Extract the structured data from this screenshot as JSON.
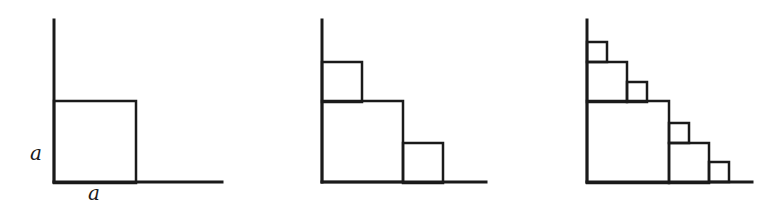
{
  "figure": {
    "panels": [
      {
        "id": "stage-1",
        "axes": {
          "origin": [
            54,
            182
          ],
          "y_top": 20,
          "x_end": 222
        },
        "squares": [
          {
            "x": 54,
            "y": 101,
            "size": 82,
            "level": 0
          }
        ],
        "labels": {
          "side_vertical": "a",
          "side_horizontal": "a"
        }
      },
      {
        "id": "stage-2",
        "axes": {
          "origin": [
            322,
            182
          ],
          "y_top": 20,
          "x_end": 486
        },
        "squares": [
          {
            "x": 322,
            "y": 101,
            "size": 81,
            "level": 0
          },
          {
            "x": 322,
            "y": 62,
            "size": 40,
            "level": 1
          },
          {
            "x": 403,
            "y": 143,
            "size": 40,
            "level": 1
          }
        ]
      },
      {
        "id": "stage-3",
        "axes": {
          "origin": [
            587,
            182
          ],
          "y_top": 20,
          "x_end": 752
        },
        "squares": [
          {
            "x": 587,
            "y": 101,
            "size": 82,
            "level": 0
          },
          {
            "x": 587,
            "y": 62,
            "size": 40,
            "level": 1
          },
          {
            "x": 669,
            "y": 143,
            "size": 40,
            "level": 1
          },
          {
            "x": 587,
            "y": 42,
            "size": 20,
            "level": 2
          },
          {
            "x": 627,
            "y": 82,
            "size": 20,
            "level": 2
          },
          {
            "x": 669,
            "y": 123,
            "size": 20,
            "level": 2
          },
          {
            "x": 709,
            "y": 162,
            "size": 20,
            "level": 2
          }
        ]
      }
    ],
    "colors": {
      "stroke": "#1a1a1a",
      "background": "#ffffff"
    }
  }
}
